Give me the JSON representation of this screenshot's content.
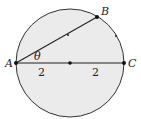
{
  "diagram": {
    "type": "geometry-circle",
    "colors": {
      "fill": "#ebebeb",
      "stroke": "#333333",
      "point": "#111111"
    },
    "circle": {
      "cx": 70,
      "cy": 63,
      "r": 54
    },
    "points": {
      "A": {
        "label": "A",
        "x": 16,
        "y": 63
      },
      "B": {
        "label": "B",
        "x": 97,
        "y": 17
      },
      "C": {
        "label": "C",
        "x": 124,
        "y": 63
      },
      "O": {
        "label": "",
        "x": 70,
        "y": 63
      }
    },
    "angle_label": "θ",
    "segment_labels": [
      "2",
      "2"
    ]
  }
}
